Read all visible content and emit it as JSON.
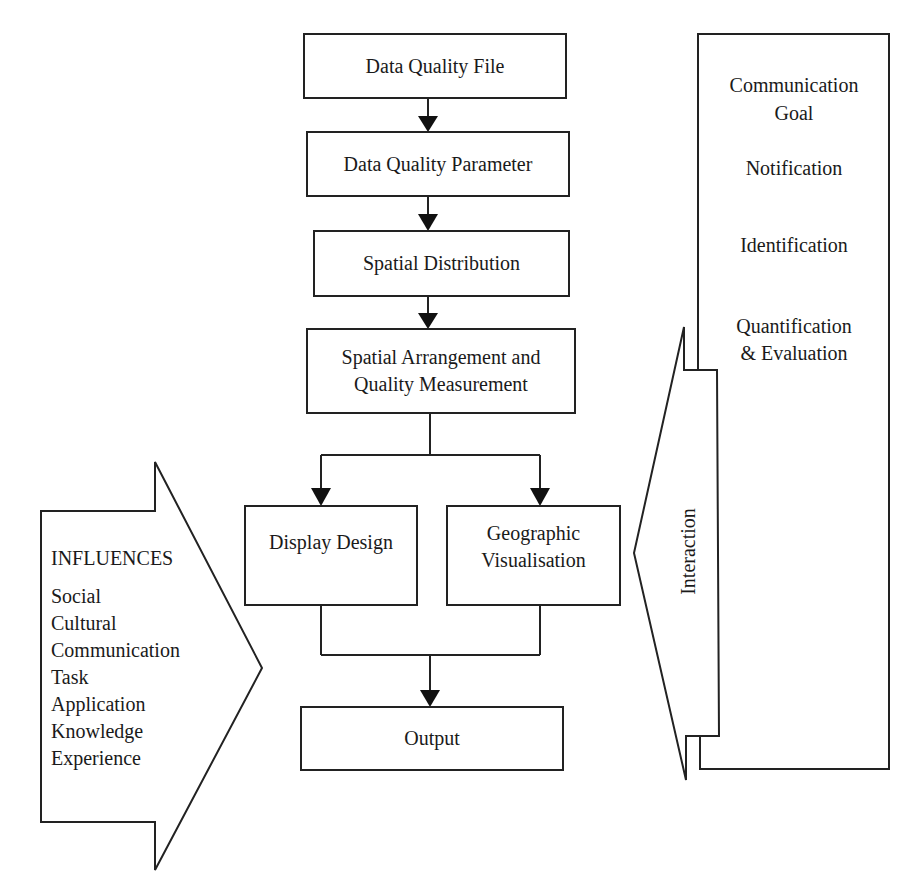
{
  "diagram": {
    "caption_fragment": "",
    "flow_boxes": [
      {
        "id": "data-quality-file",
        "label": "Data Quality File"
      },
      {
        "id": "data-quality-parameter",
        "label": "Data Quality Parameter"
      },
      {
        "id": "spatial-distribution",
        "label": "Spatial Distribution"
      },
      {
        "id": "spatial-arrangement",
        "label_line1": "Spatial Arrangement and",
        "label_line2": "Quality Measurement"
      },
      {
        "id": "display-design",
        "label": "Display Design"
      },
      {
        "id": "geographic-visualisation",
        "label_line1": "Geographic",
        "label_line2": "Visualisation"
      },
      {
        "id": "output",
        "label": "Output"
      }
    ],
    "influences": {
      "title": "INFLUENCES",
      "items": [
        "Social",
        "Cultural",
        "Communication",
        "Task",
        "Application",
        "Knowledge",
        "Experience"
      ]
    },
    "interaction": {
      "label": "Interaction"
    },
    "communication_goal": {
      "title_line1": "Communication",
      "title_line2": "Goal",
      "items": [
        "Notification",
        "Identification"
      ],
      "last_item_line1": "Quantification",
      "last_item_line2": "& Evaluation"
    },
    "colors": {
      "stroke": "#222222",
      "background": "#ffffff",
      "text": "#1a1a1a"
    }
  }
}
